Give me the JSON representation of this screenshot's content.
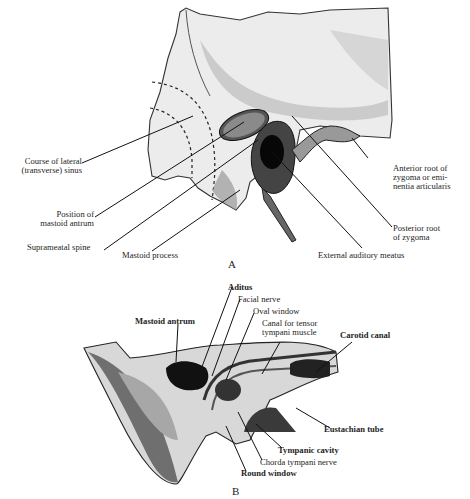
{
  "figure_a": {
    "caption": "A",
    "labels": {
      "lateral_sinus_1": "Course of lateral",
      "lateral_sinus_2": "(transverse) sinus",
      "mastoid_antrum_1": "Position of",
      "mastoid_antrum_2": "mastoid antrum",
      "suprameatal_spine": "Suprameatal spine",
      "mastoid_process": "Mastoid process",
      "external_meatus": "External auditory meatus",
      "posterior_root_1": "Posterior root",
      "posterior_root_2": "of zygoma",
      "anterior_root_1": "Anterior root of",
      "anterior_root_2": "zygoma or emi-",
      "anterior_root_3": "nentia articularis"
    }
  },
  "figure_b": {
    "caption": "B",
    "labels": {
      "aditus": "Aditus",
      "facial_nerve": "Facial nerve",
      "oval_window": "Oval window",
      "mastoid_antrum": "Mastoid antrum",
      "tensor_canal_1": "Canal for tensor",
      "tensor_canal_2": "tympani muscle",
      "carotid_canal": "Carotid canal",
      "eustachian_tube": "Eustachian tube",
      "tympanic_cavity": "Tympanic cavity",
      "chorda_tympani": "Chorda tympani nerve",
      "round_window": "Round window"
    }
  }
}
